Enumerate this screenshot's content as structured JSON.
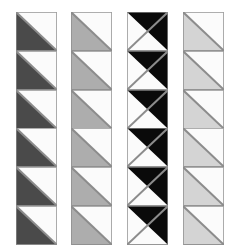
{
  "figure": {
    "background_color": "#ffffff",
    "width": 230,
    "height": 251,
    "columns_count": 4,
    "rows_per_column": 6,
    "tile_width": 41,
    "tile_height": 38.8,
    "border_color": "#8c8c8c",
    "border_width": 1,
    "white_color": "#fbfbfb"
  },
  "chart_data": {
    "type": "heatmap",
    "xlabel": "",
    "ylabel": "",
    "categories": [
      "Column 1",
      "Column 2",
      "Column 3",
      "Column 4"
    ],
    "values": [
      1,
      2,
      3,
      4
    ],
    "legend_position": "none",
    "grid": false,
    "columns": [
      {
        "index": 1,
        "name": "column-dark-gray",
        "fill_color": "#4a4a4a",
        "empty_color": "#fbfbfb",
        "diagonal": "top-left-to-bottom-right",
        "filled_half": "lower-left",
        "tiles": 6,
        "x": 16,
        "y": 12,
        "shade_label": "dark gray"
      },
      {
        "index": 2,
        "name": "column-medium-gray",
        "fill_color": "#adadad",
        "empty_color": "#fbfbfb",
        "diagonal": "top-left-to-bottom-right",
        "filled_half": "lower-left",
        "tiles": 6,
        "x": 71,
        "y": 12,
        "shade_label": "medium gray"
      },
      {
        "index": 3,
        "name": "column-black",
        "fill_color": "#0a0a0a",
        "empty_color": "#fbfbfb",
        "diagonal": "bottom-left-to-top-right",
        "filled_half": "upper-right",
        "tiles": 6,
        "x": 127,
        "y": 12,
        "shade_label": "black"
      },
      {
        "index": 4,
        "name": "column-light-gray",
        "fill_color": "#d4d4d4",
        "empty_color": "#fbfbfb",
        "diagonal": "top-left-to-bottom-right",
        "filled_half": "lower-left",
        "tiles": 6,
        "x": 183,
        "y": 12,
        "shade_label": "light gray"
      }
    ]
  }
}
